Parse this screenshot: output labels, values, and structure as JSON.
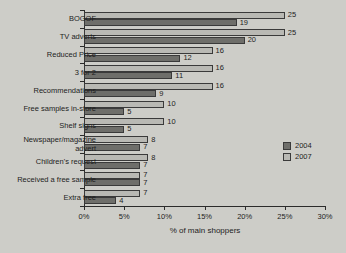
{
  "chart_data": {
    "type": "bar",
    "orientation": "horizontal",
    "title": "",
    "xlabel": "% of main shoppers",
    "ylabel": "",
    "xlim": [
      0,
      30
    ],
    "xtick_labels": [
      "0%",
      "5%",
      "10%",
      "15%",
      "20%",
      "25%",
      "30%"
    ],
    "xticks": [
      0,
      5,
      10,
      15,
      20,
      25,
      30
    ],
    "grid": false,
    "legend_position": "right",
    "categories": [
      "BOGOF",
      "TV adverts",
      "Reduced Price",
      "3 for 2",
      "Recommendations",
      "Free samples in-store",
      "Shelf signs",
      "Newspaper/magazine\nadvert",
      "Children's request",
      "Received a free sample",
      "Extra free"
    ],
    "series": [
      {
        "name": "2007",
        "color": "#b9b9b4",
        "values": [
          25,
          25,
          16,
          16,
          16,
          10,
          10,
          8,
          8,
          7,
          7
        ]
      },
      {
        "name": "2004",
        "color": "#6e6e6a",
        "values": [
          19,
          20,
          12,
          11,
          9,
          5,
          5,
          7,
          7,
          7,
          4
        ]
      }
    ]
  },
  "legend": {
    "entries": [
      {
        "label": "2004",
        "color": "#6e6e6a"
      },
      {
        "label": "2007",
        "color": "#b9b9b4"
      }
    ]
  },
  "colors": {
    "background": "#cdcdc8",
    "axis": "#2b2b2b",
    "text": "#1d1d1d",
    "series_2004": "#6e6e6a",
    "series_2007": "#b9b9b4"
  }
}
